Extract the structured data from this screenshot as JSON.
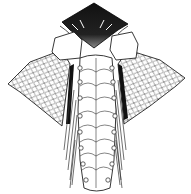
{
  "figure": {
    "colors": {
      "background": "#ffffff",
      "ink": "#1a1a1a",
      "fill": "#ffffff"
    },
    "segments": 8,
    "parts": [
      "head-crest",
      "left-head-plate",
      "right-head-plate",
      "left-fin",
      "right-fin",
      "trunk",
      "left-setae",
      "right-setae"
    ]
  }
}
